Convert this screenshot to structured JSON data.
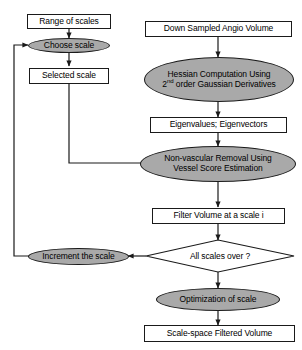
{
  "diagram": {
    "colors": {
      "process_fill": "#a9a9a9",
      "box_fill": "#ffffff",
      "stroke": "#1a1a1a",
      "background": "#ffffff"
    },
    "nodes": {
      "range_of_scales": {
        "label": "Range of scales",
        "shape": "rectangle"
      },
      "choose_scale": {
        "label": "Choose scale",
        "shape": "ellipse"
      },
      "selected_scale": {
        "label": "Selected scale",
        "shape": "rectangle"
      },
      "down_sampled_angio_volume": {
        "label": "Down Sampled Angio Volume",
        "shape": "rectangle"
      },
      "hessian_computation": {
        "line1": "Hessian Computation Using",
        "line2_pre": "2",
        "line2_sup": "nd",
        "line2_post": " order Gaussian Derivatives",
        "shape": "ellipse"
      },
      "eigen": {
        "label": "Eigenvalues; Eigenvectors",
        "shape": "rectangle"
      },
      "non_vascular_removal": {
        "line1": "Non-vascular Removal Using",
        "line2": "Vessel Score Estimation",
        "shape": "ellipse"
      },
      "filter_volume": {
        "label": "Filter Volume at a scale i",
        "shape": "rectangle"
      },
      "all_scales_over": {
        "label": "All scales over ?",
        "shape": "diamond"
      },
      "increment_the_scale": {
        "label": "Increment the scale",
        "shape": "ellipse"
      },
      "optimization_of_scale": {
        "label": "Optimization of scale",
        "shape": "ellipse"
      },
      "scale_space_filtered_volume": {
        "label": "Scale-space Filtered Volume",
        "shape": "rectangle"
      }
    }
  }
}
